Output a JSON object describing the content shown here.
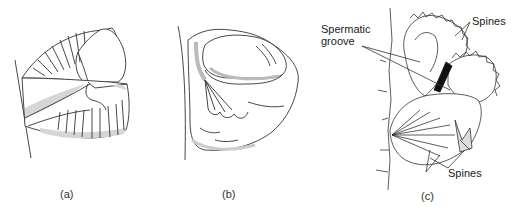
{
  "figure": {
    "panels": [
      {
        "id": "a",
        "caption": "(a)"
      },
      {
        "id": "b",
        "caption": "(b)"
      },
      {
        "id": "c",
        "caption": "(c)"
      }
    ],
    "annotations": {
      "spermatic_groove_line1": "Spermatic",
      "spermatic_groove_line2": "groove",
      "spines_top": "Spines",
      "spines_bottom": "Spines"
    },
    "colors": {
      "stroke": "#333333",
      "shade": "#d6d6d6",
      "dark": "#111111"
    }
  }
}
